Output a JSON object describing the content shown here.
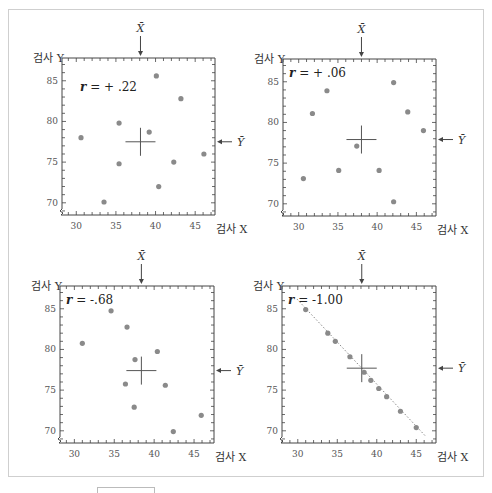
{
  "chart_data": [
    {
      "type": "scatter",
      "title": "",
      "annotation": "r = + .22",
      "r_value": "+.22",
      "xlabel": "검사 X",
      "ylabel": "검사 Y",
      "mean_x_label": "X̄",
      "mean_y_label": "Ȳ",
      "xticks": [
        30,
        35,
        40,
        45
      ],
      "yticks": [
        70,
        75,
        80,
        85
      ],
      "xlim": [
        28.2,
        47.5
      ],
      "ylim": [
        68.5,
        87.8
      ],
      "grid": false,
      "mean": {
        "x": 38.1,
        "y": 77.5
      },
      "points": [
        {
          "x": 30.6,
          "y": 78.0
        },
        {
          "x": 35.4,
          "y": 79.8
        },
        {
          "x": 39.2,
          "y": 78.7
        },
        {
          "x": 40.1,
          "y": 85.6
        },
        {
          "x": 43.2,
          "y": 82.8
        },
        {
          "x": 35.4,
          "y": 74.8
        },
        {
          "x": 42.3,
          "y": 75.0
        },
        {
          "x": 46.1,
          "y": 76.0
        },
        {
          "x": 40.4,
          "y": 72.0
        },
        {
          "x": 33.5,
          "y": 70.1
        }
      ],
      "fit_line": false
    },
    {
      "type": "scatter",
      "title": "",
      "annotation": "r = + .06",
      "r_value": "+.06",
      "xlabel": "검사 X",
      "ylabel": "검사 Y",
      "mean_x_label": "X̄",
      "mean_y_label": "Ȳ",
      "xticks": [
        30,
        35,
        40,
        45
      ],
      "yticks": [
        70,
        75,
        80,
        85
      ],
      "xlim": [
        28.0,
        47.5
      ],
      "ylim": [
        68.5,
        87.8
      ],
      "grid": false,
      "mean": {
        "x": 38.0,
        "y": 77.9
      },
      "points": [
        {
          "x": 31.75,
          "y": 81.1
        },
        {
          "x": 33.6,
          "y": 83.9
        },
        {
          "x": 42.1,
          "y": 84.9
        },
        {
          "x": 43.9,
          "y": 81.3
        },
        {
          "x": 45.9,
          "y": 79.0
        },
        {
          "x": 37.4,
          "y": 77.1
        },
        {
          "x": 35.1,
          "y": 74.1
        },
        {
          "x": 40.25,
          "y": 74.1
        },
        {
          "x": 30.6,
          "y": 73.1
        },
        {
          "x": 42.1,
          "y": 70.25
        }
      ],
      "fit_line": false
    },
    {
      "type": "scatter",
      "title": "",
      "annotation": "r = -.68",
      "r_value": "-.68",
      "xlabel": "검사 X",
      "ylabel": "검사 Y",
      "mean_x_label": "X̄",
      "mean_y_label": "Ȳ",
      "xticks": [
        30,
        35,
        40,
        45
      ],
      "yticks": [
        70,
        75,
        80,
        85
      ],
      "xlim": [
        28.2,
        47.5
      ],
      "ylim": [
        68.5,
        87.8
      ],
      "grid": false,
      "mean": {
        "x": 38.4,
        "y": 77.4
      },
      "points": [
        {
          "x": 31.0,
          "y": 80.75
        },
        {
          "x": 34.6,
          "y": 84.75
        },
        {
          "x": 36.6,
          "y": 82.75
        },
        {
          "x": 37.6,
          "y": 78.75
        },
        {
          "x": 40.4,
          "y": 79.75
        },
        {
          "x": 36.4,
          "y": 75.75
        },
        {
          "x": 41.4,
          "y": 75.6
        },
        {
          "x": 37.5,
          "y": 72.9
        },
        {
          "x": 45.9,
          "y": 71.9
        },
        {
          "x": 42.4,
          "y": 69.9
        }
      ],
      "fit_line": false
    },
    {
      "type": "scatter",
      "title": "",
      "annotation": "r = -1.00",
      "r_value": "-1.00",
      "xlabel": "검사 X",
      "ylabel": "검사 Y",
      "mean_x_label": "X̄",
      "mean_y_label": "Ȳ",
      "xticks": [
        30,
        35,
        40,
        45
      ],
      "yticks": [
        70,
        75,
        80,
        85
      ],
      "xlim": [
        28.0,
        47.5
      ],
      "ylim": [
        68.5,
        87.8
      ],
      "grid": false,
      "mean": {
        "x": 38.1,
        "y": 77.7
      },
      "points": [
        {
          "x": 31.0,
          "y": 84.9
        },
        {
          "x": 33.8,
          "y": 82.0
        },
        {
          "x": 34.75,
          "y": 81.0
        },
        {
          "x": 36.6,
          "y": 79.1
        },
        {
          "x": 38.4,
          "y": 77.2
        },
        {
          "x": 39.25,
          "y": 76.2
        },
        {
          "x": 40.25,
          "y": 75.2
        },
        {
          "x": 41.25,
          "y": 74.2
        },
        {
          "x": 43.0,
          "y": 72.4
        },
        {
          "x": 45.0,
          "y": 70.4
        }
      ],
      "fit_line": true,
      "fit_line_range": {
        "x0": 29.9,
        "x1": 46.2
      }
    }
  ],
  "layout": {
    "panels": [
      {
        "left": 62,
        "top": 58,
        "right": 215,
        "bottom": 215
      },
      {
        "left": 283,
        "top": 59,
        "right": 436,
        "bottom": 216
      },
      {
        "left": 60,
        "top": 286,
        "right": 214,
        "bottom": 443
      },
      {
        "left": 282,
        "top": 286,
        "right": 436,
        "bottom": 443
      }
    ]
  },
  "colors": {
    "point": "#8a8a8a",
    "axis": "#444444",
    "crosshair": "#555555",
    "fit_line": "#888888"
  }
}
